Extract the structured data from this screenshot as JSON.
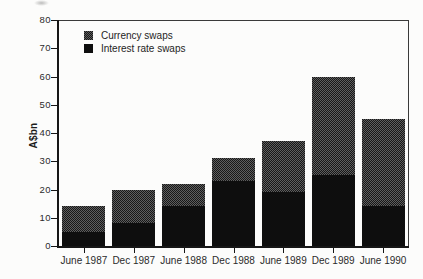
{
  "figure": {
    "background": "#fcfcfb"
  },
  "chart_data": {
    "type": "bar",
    "stacked": true,
    "title": "",
    "xlabel": "",
    "ylabel": "A$bn",
    "ylim": [
      0,
      80
    ],
    "yticks": [
      0,
      10,
      20,
      30,
      40,
      50,
      60,
      70,
      80
    ],
    "grid": false,
    "legend_position": "top-left-inside",
    "categories": [
      "June 1987",
      "Dec 1987",
      "June 1988",
      "Dec 1988",
      "June 1989",
      "Dec 1989",
      "June 1990"
    ],
    "series": [
      {
        "name": "Interest rate swaps",
        "stack_order": "bottom",
        "color": "#0e0e0e",
        "pattern": "solid",
        "values": [
          5,
          8,
          14,
          23,
          19,
          25,
          14
        ]
      },
      {
        "name": "Currency swaps",
        "stack_order": "top",
        "color": "#3a3a3a",
        "pattern": "dither",
        "values": [
          9,
          12,
          8,
          8,
          18,
          35,
          31
        ]
      }
    ],
    "legend_items": [
      {
        "label": "Currency swaps",
        "pattern": "dither"
      },
      {
        "label": "Interest rate swaps",
        "pattern": "solid"
      }
    ]
  },
  "colors": {
    "axis": "#161616",
    "text": "#2b2b2b",
    "interest_rate_swaps": "#0e0e0e",
    "currency_swaps": "#3a3a3a",
    "background": "#fcfcfb"
  }
}
